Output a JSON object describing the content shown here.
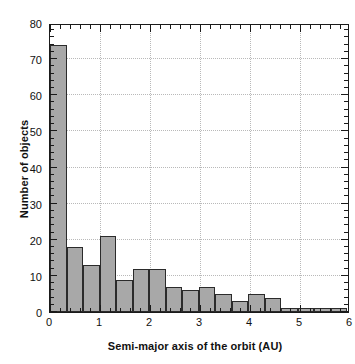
{
  "chart_data": {
    "type": "bar",
    "title": "",
    "xlabel": "Semi-major axis of the orbit (AU)",
    "ylabel": "Number of objects",
    "xlim": [
      0,
      6
    ],
    "ylim": [
      0,
      80
    ],
    "bin_width": 0.33,
    "grid": true,
    "legend": null,
    "bar_color": "#a8a8a8",
    "bar_edge_color": "#2b2b2b",
    "xticks": [
      0,
      1,
      2,
      3,
      4,
      5,
      6
    ],
    "xtick_labels": [
      "0",
      "1",
      "2",
      "3",
      "4",
      "5",
      "6"
    ],
    "yticks": [
      0,
      10,
      20,
      30,
      40,
      50,
      60,
      70,
      80
    ],
    "ytick_labels": [
      "0",
      "10",
      "20",
      "30",
      "40",
      "50",
      "60",
      "70",
      "80"
    ],
    "bins": [
      {
        "x0": 0.0,
        "x1": 0.33,
        "value": 74
      },
      {
        "x0": 0.33,
        "x1": 0.66,
        "value": 18
      },
      {
        "x0": 0.66,
        "x1": 0.99,
        "value": 13
      },
      {
        "x0": 0.99,
        "x1": 1.32,
        "value": 21
      },
      {
        "x0": 1.32,
        "x1": 1.65,
        "value": 9
      },
      {
        "x0": 1.65,
        "x1": 1.98,
        "value": 12
      },
      {
        "x0": 1.98,
        "x1": 2.31,
        "value": 12
      },
      {
        "x0": 2.31,
        "x1": 2.64,
        "value": 7
      },
      {
        "x0": 2.64,
        "x1": 2.97,
        "value": 6
      },
      {
        "x0": 2.97,
        "x1": 3.3,
        "value": 7
      },
      {
        "x0": 3.3,
        "x1": 3.63,
        "value": 5
      },
      {
        "x0": 3.63,
        "x1": 3.96,
        "value": 3
      },
      {
        "x0": 3.96,
        "x1": 4.29,
        "value": 5
      },
      {
        "x0": 4.29,
        "x1": 4.62,
        "value": 4
      },
      {
        "x0": 4.62,
        "x1": 4.95,
        "value": 1
      },
      {
        "x0": 4.95,
        "x1": 5.28,
        "value": 1
      },
      {
        "x0": 5.28,
        "x1": 5.61,
        "value": 1
      },
      {
        "x0": 5.61,
        "x1": 5.94,
        "value": 1
      }
    ],
    "categories": [
      "0.00-0.33",
      "0.33-0.66",
      "0.66-0.99",
      "0.99-1.32",
      "1.32-1.65",
      "1.65-1.98",
      "1.98-2.31",
      "2.31-2.64",
      "2.64-2.97",
      "2.97-3.30",
      "3.30-3.63",
      "3.63-3.96",
      "3.96-4.29",
      "4.29-4.62",
      "4.62-4.95",
      "4.95-5.28",
      "5.28-5.61",
      "5.61-5.94"
    ],
    "values": [
      74,
      18,
      13,
      21,
      9,
      12,
      12,
      7,
      6,
      7,
      5,
      3,
      5,
      4,
      1,
      1,
      1,
      1
    ]
  }
}
